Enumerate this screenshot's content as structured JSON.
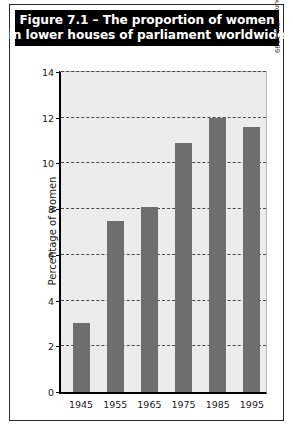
{
  "figure": {
    "title_line_1": "Figure 7.1 – The proportion of women",
    "title_line_2": "in lower houses of parliament worldwide",
    "source_note": "Source: IPU, 1999"
  },
  "chart_data": {
    "type": "bar",
    "title": "Figure 7.1 – The proportion of women in lower houses of parliament worldwide",
    "categories": [
      "1945",
      "1955",
      "1965",
      "1975",
      "1985",
      "1995"
    ],
    "values": [
      3.0,
      7.5,
      8.1,
      10.9,
      12.0,
      11.6
    ],
    "xlabel": "",
    "ylabel": "Percentage of women",
    "ylim": [
      0,
      14
    ],
    "ytick_labels": [
      "0",
      "2",
      "4",
      "6",
      "8",
      "10",
      "12",
      "14"
    ],
    "ytick_values": [
      0,
      2,
      4,
      6,
      8,
      10,
      12,
      14
    ],
    "grid": true,
    "grid_style": "dashed-horizontal",
    "legend": null,
    "bar_color": "#6e6e6e",
    "plot_background": "#ececec",
    "banner_background": "#000000",
    "banner_text_color": "#ffffff",
    "source": "Source: IPU, 1999"
  }
}
